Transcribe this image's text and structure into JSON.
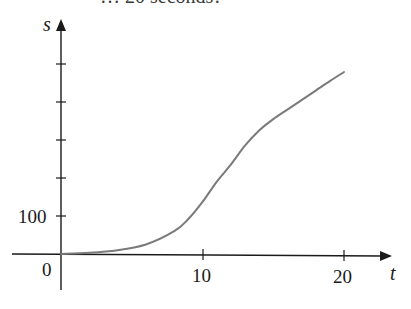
{
  "top_text": "… 20 seconds?",
  "chart_data": {
    "type": "line",
    "title": "",
    "xlabel": "t",
    "ylabel": "s",
    "x_ticks": [
      10,
      20
    ],
    "x_tick_labels": [
      "10",
      "20"
    ],
    "y_ticks": [
      100,
      200,
      300,
      400,
      500
    ],
    "y_tick_labels": [
      "100",
      "",
      "",
      "",
      ""
    ],
    "origin_label": "0",
    "xlim": [
      0,
      23
    ],
    "ylim": [
      0,
      520
    ],
    "grid": false,
    "legend": null,
    "series": [
      {
        "name": "s(t)",
        "color": "#7a7a7a",
        "x": [
          0,
          2,
          4,
          6,
          8,
          9,
          10,
          11,
          12,
          13,
          14,
          15,
          16,
          17,
          18,
          19,
          20
        ],
        "y": [
          0,
          3,
          10,
          25,
          60,
          92,
          137,
          190,
          235,
          285,
          325,
          355,
          380,
          405,
          430,
          455,
          479
        ]
      }
    ]
  },
  "colors": {
    "axis": "#1a1a1a",
    "curve": "#7a7a7a",
    "background": "#ffffff"
  }
}
